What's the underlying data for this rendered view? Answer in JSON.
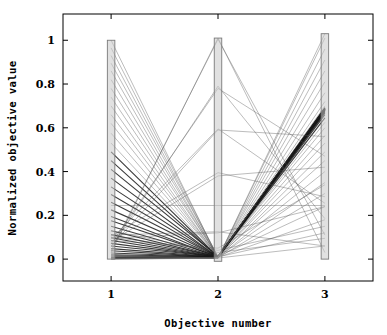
{
  "chart_data": {
    "type": "line",
    "subtype": "parallel-coordinates",
    "title": "",
    "xlabel": "Objective number",
    "ylabel": "Normalized objective value",
    "x": [
      1,
      2,
      3
    ],
    "xticklabels": [
      "1",
      "2",
      "3"
    ],
    "yticks": [
      0,
      0.2,
      0.4,
      0.6,
      0.8,
      1
    ],
    "yticklabels": [
      "0",
      "0.2",
      "0.4",
      "0.6",
      "0.8",
      "1"
    ],
    "xlim": [
      0.55,
      3.45
    ],
    "ylim": [
      -0.1,
      1.12
    ],
    "grid": false,
    "legend": null,
    "axis_bars": [
      {
        "axis": 1,
        "min": 0.0,
        "max": 1.0
      },
      {
        "axis": 2,
        "min": -0.01,
        "max": 1.01
      },
      {
        "axis": 3,
        "min": 0.0,
        "max": 1.03
      }
    ],
    "bar_fill": "#c9c9c9",
    "bar_stroke": "#7a7a7a",
    "line_color": "#555555",
    "dense_line_color": "#1a1a1a",
    "background": "#ffffff",
    "series": [
      {
        "name": "sol-01",
        "values": [
          1.0,
          0.005,
          0.06
        ]
      },
      {
        "name": "sol-02",
        "values": [
          0.965,
          0.01,
          0.12
        ]
      },
      {
        "name": "sol-03",
        "values": [
          0.93,
          0.008,
          0.18
        ]
      },
      {
        "name": "sol-04",
        "values": [
          0.895,
          0.012,
          0.24
        ]
      },
      {
        "name": "sol-05",
        "values": [
          0.86,
          0.006,
          0.3
        ]
      },
      {
        "name": "sol-06",
        "values": [
          0.82,
          0.01,
          0.35
        ]
      },
      {
        "name": "sol-07",
        "values": [
          0.78,
          0.008,
          0.4
        ]
      },
      {
        "name": "sol-08",
        "values": [
          0.74,
          0.012,
          0.45
        ]
      },
      {
        "name": "sol-09",
        "values": [
          0.7,
          0.007,
          0.49
        ]
      },
      {
        "name": "sol-10",
        "values": [
          0.66,
          0.01,
          0.53
        ]
      },
      {
        "name": "sol-11",
        "values": [
          0.62,
          0.009,
          0.565
        ]
      },
      {
        "name": "sol-12",
        "values": [
          0.575,
          0.011,
          0.6
        ]
      },
      {
        "name": "sol-13",
        "values": [
          0.53,
          0.008,
          0.625
        ]
      },
      {
        "name": "sol-14",
        "values": [
          0.49,
          0.01,
          0.645
        ]
      },
      {
        "name": "sol-15",
        "values": [
          0.45,
          0.009,
          0.66
        ]
      },
      {
        "name": "sol-16",
        "values": [
          0.41,
          0.012,
          0.668
        ]
      },
      {
        "name": "sol-17",
        "values": [
          0.37,
          0.008,
          0.672
        ]
      },
      {
        "name": "sol-18",
        "values": [
          0.33,
          0.01,
          0.676
        ]
      },
      {
        "name": "sol-19",
        "values": [
          0.295,
          0.009,
          0.678
        ]
      },
      {
        "name": "sol-20",
        "values": [
          0.26,
          0.011,
          0.68
        ]
      },
      {
        "name": "sol-21",
        "values": [
          0.225,
          0.01,
          0.681
        ]
      },
      {
        "name": "sol-22",
        "values": [
          0.195,
          0.009,
          0.682
        ]
      },
      {
        "name": "sol-23",
        "values": [
          0.175,
          0.012,
          0.683
        ]
      },
      {
        "name": "sol-24",
        "values": [
          0.15,
          0.01,
          0.683
        ]
      },
      {
        "name": "sol-25",
        "values": [
          0.13,
          0.009,
          0.684
        ]
      },
      {
        "name": "sol-26",
        "values": [
          0.112,
          0.011,
          0.684
        ]
      },
      {
        "name": "sol-27",
        "values": [
          0.098,
          0.01,
          0.685
        ]
      },
      {
        "name": "sol-28",
        "values": [
          0.085,
          0.009,
          0.685
        ]
      },
      {
        "name": "sol-29",
        "values": [
          0.072,
          0.01,
          0.686
        ]
      },
      {
        "name": "sol-30",
        "values": [
          0.06,
          0.011,
          0.686
        ]
      },
      {
        "name": "sol-31",
        "values": [
          0.048,
          0.01,
          0.687
        ]
      },
      {
        "name": "sol-32",
        "values": [
          0.038,
          0.009,
          0.687
        ]
      },
      {
        "name": "sol-33",
        "values": [
          0.028,
          0.01,
          0.688
        ]
      },
      {
        "name": "sol-34",
        "values": [
          0.02,
          0.011,
          0.688
        ]
      },
      {
        "name": "sol-35",
        "values": [
          0.014,
          0.01,
          0.689
        ]
      },
      {
        "name": "sol-36",
        "values": [
          0.008,
          0.009,
          0.69
        ]
      },
      {
        "name": "sol-37",
        "values": [
          0.004,
          0.01,
          0.692
        ]
      },
      {
        "name": "sol-38",
        "values": [
          0.002,
          0.008,
          0.7
        ]
      },
      {
        "name": "sol-39",
        "values": [
          0.0,
          0.006,
          0.72
        ]
      },
      {
        "name": "sol-40",
        "values": [
          0.0,
          0.004,
          0.76
        ]
      },
      {
        "name": "sol-41",
        "values": [
          0.002,
          0.003,
          0.81
        ]
      },
      {
        "name": "sol-42",
        "values": [
          0.004,
          0.005,
          0.86
        ]
      },
      {
        "name": "sol-43",
        "values": [
          0.006,
          0.004,
          0.91
        ]
      },
      {
        "name": "sol-44",
        "values": [
          0.01,
          0.006,
          0.96
        ]
      },
      {
        "name": "sol-45",
        "values": [
          0.014,
          0.005,
          1.01
        ]
      },
      {
        "name": "sol-46",
        "values": [
          0.018,
          0.004,
          1.03
        ]
      },
      {
        "name": "sol-47",
        "values": [
          0.03,
          1.01,
          0.03
        ]
      },
      {
        "name": "sol-48",
        "values": [
          0.04,
          1.005,
          0.11
        ]
      },
      {
        "name": "sol-49",
        "values": [
          0.055,
          0.79,
          0.185
        ]
      },
      {
        "name": "sol-50",
        "values": [
          0.07,
          0.78,
          0.47
        ]
      },
      {
        "name": "sol-51",
        "values": [
          0.09,
          0.595,
          0.255
        ]
      },
      {
        "name": "sol-52",
        "values": [
          0.06,
          0.59,
          0.56
        ]
      },
      {
        "name": "sol-53",
        "values": [
          0.105,
          0.395,
          0.285
        ]
      },
      {
        "name": "sol-54",
        "values": [
          0.08,
          0.38,
          0.42
        ]
      },
      {
        "name": "sol-55",
        "values": [
          0.245,
          0.245,
          0.245
        ]
      },
      {
        "name": "sol-56",
        "values": [
          0.11,
          0.125,
          0.06
        ]
      },
      {
        "name": "sol-57",
        "values": [
          0.095,
          0.12,
          0.24
        ]
      },
      {
        "name": "sol-58",
        "values": [
          0.1,
          0.04,
          0.15
        ]
      },
      {
        "name": "sol-59",
        "values": [
          0.13,
          0.03,
          0.095
        ]
      },
      {
        "name": "sol-60",
        "values": [
          0.085,
          0.05,
          0.34
        ]
      }
    ]
  },
  "axes": {
    "x_axis_title": "Objective number",
    "y_axis_title": "Normalized objective value"
  }
}
